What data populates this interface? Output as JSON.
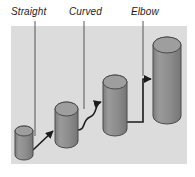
{
  "figure": {
    "background_color": "#ffffff",
    "panel": {
      "fill_color": "#dcdcdc",
      "x": 11,
      "y": 26,
      "width": 176,
      "height": 138
    },
    "callouts": [
      {
        "label": "Straight",
        "label_x": 11,
        "label_y": 6,
        "leader_x": 35,
        "leader_y_top": 21,
        "leader_y_bottom": 136
      },
      {
        "label": "Curved",
        "label_x": 69,
        "label_y": 6,
        "leader_x": 84,
        "leader_y_top": 21,
        "leader_y_bottom": 109
      },
      {
        "label": "Elbow",
        "label_x": 131,
        "label_y": 6,
        "leader_x": 143,
        "leader_y_top": 21,
        "leader_y_bottom": 76
      }
    ],
    "leader_line_color": "#555555",
    "cylinders": [
      {
        "name": "cylinder-1",
        "x": 15,
        "y": 126,
        "width": 18,
        "height": 34,
        "body_color": "#8a8a8a",
        "top_color": "#9e9e9e",
        "stroke_color": "#4a4a4a"
      },
      {
        "name": "cylinder-2",
        "x": 55,
        "y": 102,
        "width": 23,
        "height": 46,
        "body_color": "#8a8a8a",
        "top_color": "#9e9e9e",
        "stroke_color": "#4a4a4a"
      },
      {
        "name": "cylinder-3",
        "x": 103,
        "y": 75,
        "width": 24,
        "height": 61,
        "body_color": "#8a8a8a",
        "top_color": "#9e9e9e",
        "stroke_color": "#4a4a4a"
      },
      {
        "name": "cylinder-4",
        "x": 153,
        "y": 37,
        "width": 28,
        "height": 87,
        "body_color": "#8a8a8a",
        "top_color": "#9e9e9e",
        "stroke_color": "#4a4a4a"
      }
    ],
    "connectors": [
      {
        "name": "straight-connector",
        "type": "straight",
        "path": "M 33 150 L 53 131",
        "color": "#1b1b1b"
      },
      {
        "name": "curved-connector",
        "type": "curved",
        "path": "M 78 130 C 86 130 82 120 90 117 C 98 114 94 104 101 102",
        "color": "#1b1b1b"
      },
      {
        "name": "elbow-connector",
        "type": "elbow",
        "path": "M 127 122 L 143 122 L 143 79 L 151 79",
        "color": "#1b1b1b"
      }
    ],
    "arrowhead_color": "#1b1b1b"
  }
}
